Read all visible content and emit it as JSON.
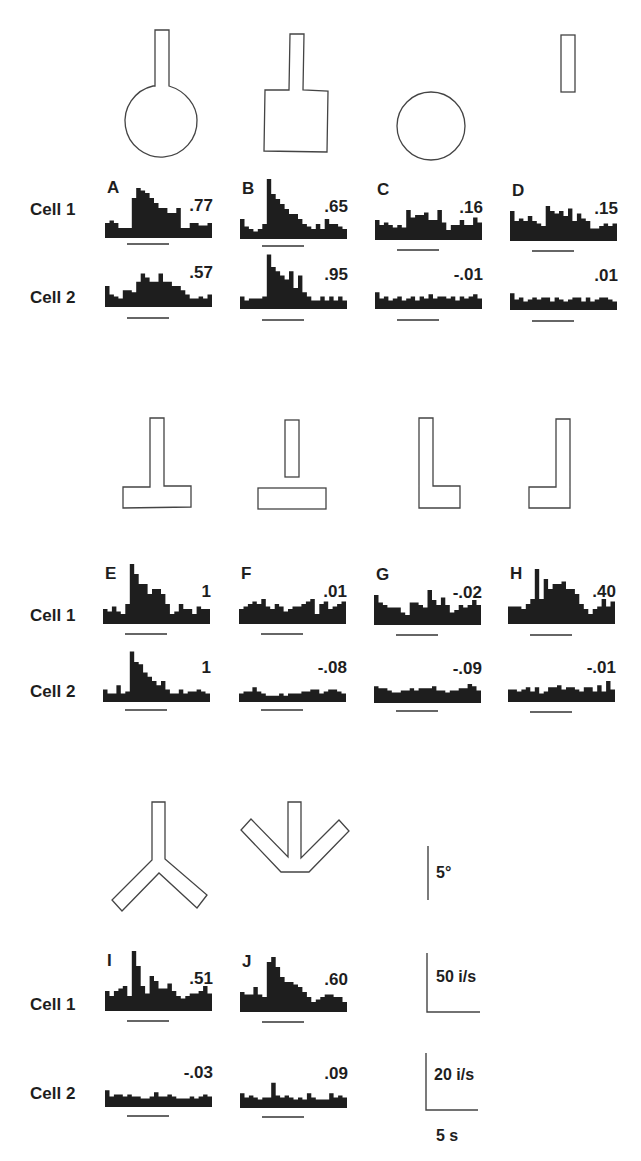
{
  "figure": {
    "row_labels": {
      "cell1": "Cell 1",
      "cell2": "Cell 2"
    },
    "scale_bars": {
      "angle": "5°",
      "rate_cell1": "50 i/s",
      "rate_cell2": "20 i/s",
      "time": "5 s"
    },
    "colors": {
      "ink": "#1e1e1e",
      "outline": "#444444",
      "background": "#ffffff"
    }
  },
  "chart_data": {
    "type": "bar",
    "title": "",
    "xlabel": "time (5 s scale bar)",
    "ylabel": "firing rate (Cell 1: 50 i/s scale; Cell 2: 20 i/s scale)",
    "panels": [
      {
        "id": "A",
        "shape": "circle-with-stem",
        "cell1": {
          "index": ".77",
          "bins": [
            3,
            3.5,
            3,
            2,
            2,
            2,
            8,
            10,
            9.5,
            9,
            8,
            7,
            6,
            6,
            5,
            5,
            6,
            2,
            2,
            3,
            3,
            2.5,
            2.5,
            3
          ]
        },
        "cell2": {
          "index": ".57",
          "bins": [
            5,
            3,
            2.5,
            2,
            4,
            4,
            3.5,
            6,
            8,
            7,
            6,
            6,
            8,
            6,
            6,
            5,
            5,
            4,
            3,
            2,
            2,
            2.5,
            2,
            3
          ]
        }
      },
      {
        "id": "B",
        "shape": "square-with-stem",
        "cell1": {
          "index": ".65",
          "bins": [
            4,
            2.5,
            2,
            1.5,
            2,
            3,
            12,
            9,
            8,
            7,
            6,
            5,
            5,
            4,
            3,
            2.5,
            2,
            3,
            2,
            4,
            3,
            3,
            2.5,
            2
          ]
        },
        "cell2": {
          "index": ".95",
          "bins": [
            3,
            2,
            2.5,
            2.5,
            2.5,
            3,
            13,
            10,
            9,
            8,
            7,
            9,
            5,
            8,
            4,
            3,
            2,
            2,
            3,
            2,
            3,
            2,
            3,
            2
          ]
        }
      },
      {
        "id": "C",
        "shape": "circle",
        "cell1": {
          "index": ".16",
          "bins": [
            4,
            3,
            3.5,
            3,
            2.5,
            3,
            2.5,
            6,
            4.5,
            5,
            5,
            5.5,
            4,
            4,
            6,
            3.5,
            2,
            3,
            3,
            4,
            3,
            3,
            4.5,
            3.5
          ]
        },
        "cell2": {
          "index": "-.01",
          "bins": [
            4,
            2.5,
            3,
            2,
            2.5,
            3,
            2,
            2.5,
            3,
            2,
            3,
            2.5,
            3.5,
            2.5,
            3,
            3,
            2.5,
            3,
            2,
            3,
            2.5,
            3,
            3.5,
            2.5
          ]
        }
      },
      {
        "id": "D",
        "shape": "stem",
        "cell1": {
          "index": ".15",
          "bins": [
            6,
            4,
            4.5,
            4,
            5,
            4,
            3.5,
            3,
            7,
            6,
            5.5,
            6,
            5,
            6.5,
            4,
            5.5,
            4.5,
            4,
            2.5,
            2.5,
            3,
            3.5,
            3,
            3.5
          ]
        },
        "cell2": {
          "index": ".01",
          "bins": [
            4,
            2.5,
            3,
            2,
            2.5,
            3,
            2.5,
            3,
            3,
            2,
            3,
            2.5,
            2,
            2.5,
            3,
            3,
            2,
            3,
            2,
            2.5,
            3,
            3,
            2.5,
            2
          ]
        }
      },
      {
        "id": "E",
        "shape": "inverted-T",
        "cell1": {
          "index": "1",
          "bins": [
            3,
            2.5,
            3.5,
            2.5,
            2,
            4,
            12,
            10,
            8,
            8,
            6,
            7,
            7,
            6,
            4,
            2,
            2.5,
            4,
            3,
            3,
            2,
            3.5,
            3,
            3
          ]
        },
        "cell2": {
          "index": "1",
          "bins": [
            3,
            2,
            2,
            4,
            2,
            2.5,
            12,
            9.5,
            9,
            7,
            6,
            5,
            4,
            5,
            3,
            2,
            2,
            3,
            2,
            2.5,
            2.5,
            3,
            2.5,
            2
          ]
        }
      },
      {
        "id": "F",
        "shape": "stem-above-bar",
        "cell1": {
          "index": ".01",
          "bins": [
            3,
            3.5,
            4,
            4.5,
            4,
            5,
            3.5,
            3,
            4,
            3.5,
            2.5,
            3,
            3.5,
            3.5,
            4,
            4.5,
            5,
            2,
            4,
            4.5,
            3,
            3.5,
            4,
            4.5
          ]
        },
        "cell2": {
          "index": "-.08",
          "bins": [
            2,
            2.5,
            2.5,
            3.5,
            2.5,
            2,
            1.5,
            1.5,
            1.5,
            2,
            1.5,
            2,
            2,
            2,
            2.5,
            2.5,
            3,
            3,
            2,
            2.5,
            3,
            3,
            2.5,
            2
          ]
        }
      },
      {
        "id": "G",
        "shape": "L",
        "cell1": {
          "index": "-.02",
          "bins": [
            6,
            4.5,
            4,
            3.5,
            3.5,
            3.5,
            2.5,
            2,
            4.5,
            4.5,
            4,
            3.5,
            7,
            5,
            4,
            5.5,
            4,
            2.5,
            3,
            4,
            3.5,
            4,
            5,
            4
          ]
        },
        "cell2": {
          "index": "-.09",
          "bins": [
            4,
            3.5,
            3.5,
            3,
            2.5,
            2.5,
            3,
            3,
            3.5,
            3,
            3.5,
            3.5,
            3.5,
            4,
            3,
            3,
            2.5,
            3,
            3,
            3.5,
            3.5,
            4.5,
            4,
            3
          ]
        }
      },
      {
        "id": "H",
        "shape": "mirror-L",
        "cell1": {
          "index": ".40",
          "bins": [
            3.5,
            3.5,
            3.5,
            3,
            4,
            5,
            11,
            5,
            9,
            7,
            8,
            8,
            8.5,
            7,
            7,
            6,
            4,
            3,
            2,
            3,
            3.5,
            5,
            3.5,
            4.5
          ]
        },
        "cell2": {
          "index": "-.01",
          "bins": [
            3,
            3,
            2.5,
            3,
            3.5,
            2.5,
            3.5,
            2,
            2.5,
            3.5,
            3.5,
            4,
            3,
            3.5,
            3.5,
            3,
            2.5,
            3.5,
            3.5,
            2.5,
            4,
            2.5,
            5,
            3
          ]
        }
      },
      {
        "id": "I",
        "shape": "Y",
        "cell1": {
          "index": ".51",
          "bins": [
            4,
            3,
            4,
            4.5,
            5,
            3,
            12,
            9,
            5,
            3.5,
            7,
            6,
            4.5,
            4.5,
            5.5,
            4,
            3,
            2.5,
            3,
            3.5,
            3.5,
            4,
            5,
            3.5
          ]
        },
        "cell2": {
          "index": "-.03",
          "bins": [
            4,
            2.5,
            3,
            3,
            2.5,
            3,
            2.5,
            2.5,
            2,
            2,
            2.5,
            3.5,
            2.5,
            2.5,
            3,
            2.5,
            2,
            2,
            2,
            2.5,
            2,
            2.5,
            3,
            2.5
          ]
        }
      },
      {
        "id": "J",
        "shape": "arrow-down",
        "cell1": {
          "index": ".60",
          "bins": [
            4,
            3.5,
            3.5,
            5,
            3.5,
            3,
            10,
            11,
            9,
            7,
            6,
            6,
            5.5,
            5,
            4,
            3,
            2,
            2.5,
            3,
            3.5,
            3.5,
            3,
            3,
            2
          ]
        },
        "cell2": {
          "index": ".09",
          "bins": [
            3.5,
            2.5,
            3,
            2.5,
            2,
            2.5,
            2.5,
            6,
            3,
            2.5,
            3,
            2.5,
            2,
            2.5,
            2,
            3.5,
            2.5,
            2,
            2,
            2,
            3.5,
            2.5,
            3,
            2.5
          ]
        }
      }
    ]
  }
}
